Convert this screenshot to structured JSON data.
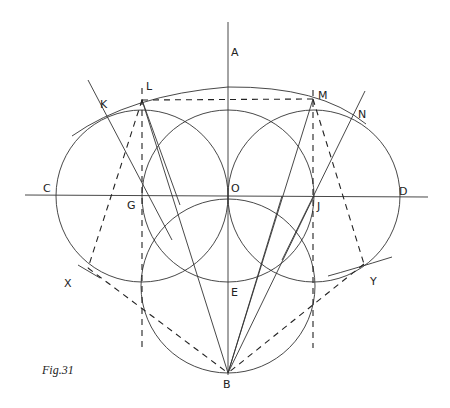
{
  "figure": {
    "caption": "Fig.31",
    "labels": {
      "A": "A",
      "B": "B",
      "C": "C",
      "D": "D",
      "E": "E",
      "G": "G",
      "J": "J",
      "K": "K",
      "L": "L",
      "M": "M",
      "N": "N",
      "O": "O",
      "X": "X",
      "Y": "Y"
    },
    "points": {
      "O": [
        228,
        196
      ],
      "G": [
        142,
        196
      ],
      "J": [
        314,
        196
      ],
      "L": [
        142,
        100
      ],
      "M": [
        313,
        99
      ],
      "B": [
        228,
        373
      ],
      "E": [
        228,
        286
      ],
      "K": [
        102,
        173
      ],
      "N": [
        352,
        116
      ],
      "X": [
        88,
        268
      ],
      "Y": [
        364,
        264
      ]
    },
    "circles": [
      {
        "name": "left",
        "cx": 142,
        "cy": 196,
        "r": 86
      },
      {
        "name": "center-top",
        "cx": 228,
        "cy": 196,
        "r": 86
      },
      {
        "name": "right",
        "cx": 314,
        "cy": 196,
        "r": 86
      },
      {
        "name": "bottom",
        "cx": 228,
        "cy": 286,
        "r": 87
      }
    ]
  }
}
